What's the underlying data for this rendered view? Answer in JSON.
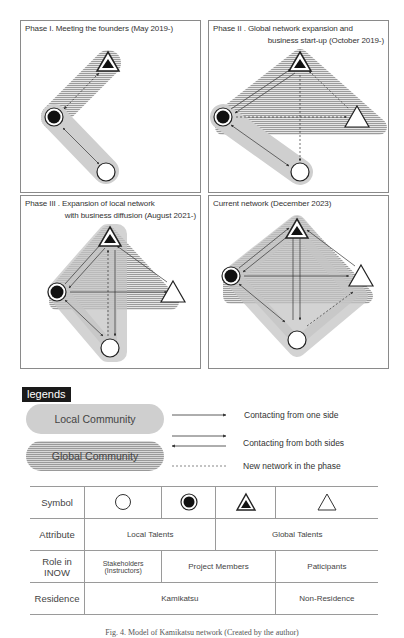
{
  "panels": [
    {
      "id": "phase1",
      "title_line1": "Phase I. Meeting the founders (May 2019-)",
      "title_line2": ""
    },
    {
      "id": "phase2",
      "title_line1": "Phase  II . Global network expansion and",
      "title_line2": "business start-up (October 2019-)"
    },
    {
      "id": "phase3",
      "title_line1": "Phase  III . Expansion of local network",
      "title_line2": "with business diffusion (August 2021-)"
    },
    {
      "id": "current",
      "title_line1": "Current network (December 2023)",
      "title_line2": ""
    }
  ],
  "legend": {
    "tag": "legends",
    "local_community": "Local Community",
    "global_community": "Global Community",
    "one_side": "Contacting from one side",
    "both_sides": "Contacting from both sides",
    "new_network": "New network in the phase"
  },
  "table": {
    "rows": {
      "symbol": "Symbol",
      "attribute": "Attribute",
      "role_line1": "Role in",
      "role_line2": "INOW",
      "residence": "Residence"
    },
    "symbols": [
      "open-circle",
      "filled-circle",
      "filled-triangle",
      "open-triangle"
    ],
    "attribute": {
      "local": "Local Talents",
      "global": "Global Talents"
    },
    "role": {
      "stakeholders_line1": "Stakeholders",
      "stakeholders_line2": "(Instructors)",
      "project_members": "Project Members",
      "participants": "Paticipants"
    },
    "residence": {
      "kamikatsu": "Kamikatsu",
      "non_residence": "Non-Residence"
    }
  },
  "caption": "Fig. 4. Model of Kamikatsu network (Created by the author)",
  "colors": {
    "local_fill": "#cfcfcf",
    "global_stripe": "#9a9a9a",
    "border": "#8a8a8a",
    "legend_tag_bg": "#1a1a1a"
  }
}
